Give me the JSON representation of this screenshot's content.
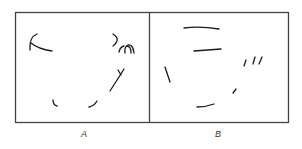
{
  "figure": {
    "panels": [
      {
        "id": "A",
        "label": "A",
        "description": "Fragmented contour strokes (sparse edge fragments)",
        "stroke_groups": [
          "top-left-arc",
          "top-right-curls",
          "right-diagonal",
          "bottom-left-hook",
          "bottom-middle-hook"
        ]
      },
      {
        "id": "B",
        "label": "B",
        "description": "Fragmented contour strokes (rearranged edge fragments)",
        "stroke_groups": [
          "top-line-1",
          "top-line-2",
          "left-slash",
          "right-ticks",
          "center-tick",
          "bottom-line"
        ]
      }
    ],
    "colors": {
      "frame": "#444444",
      "stroke": "#1a1a1a",
      "background": "#ffffff"
    }
  }
}
